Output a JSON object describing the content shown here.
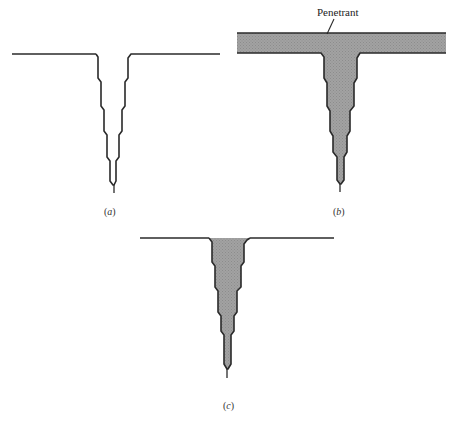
{
  "figure": {
    "colors": {
      "line": "#2a2a2a",
      "penetrant_fill": "#9c9c9c",
      "background": "#ffffff"
    },
    "panels": [
      {
        "id": "a",
        "caption": "(a)",
        "caption_letter": "a",
        "description": "Open surface crack, empty",
        "surface_left": [
          [
            12,
            54
          ],
          [
            96,
            54
          ]
        ],
        "surface_right": [
          [
            136,
            54
          ],
          [
            220,
            54
          ]
        ],
        "crack_outline": [
          [
            96,
            54
          ],
          [
            98,
            57
          ],
          [
            98,
            78
          ],
          [
            101,
            82
          ],
          [
            101,
            106
          ],
          [
            104,
            110
          ],
          [
            104,
            131
          ],
          [
            107,
            135
          ],
          [
            107,
            157
          ],
          [
            110,
            161
          ],
          [
            110,
            181
          ],
          [
            113,
            185
          ],
          [
            114,
            185
          ],
          [
            116,
            181
          ],
          [
            116,
            161
          ],
          [
            119,
            157
          ],
          [
            119,
            135
          ],
          [
            122,
            131
          ],
          [
            122,
            110
          ],
          [
            125,
            106
          ],
          [
            125,
            82
          ],
          [
            128,
            78
          ],
          [
            128,
            58
          ],
          [
            131,
            54
          ],
          [
            136,
            54
          ]
        ],
        "tip_tail": [
          [
            114,
            185
          ],
          [
            114,
            193
          ]
        ],
        "filled": false,
        "caption_pos": {
          "x": 104,
          "y": 207
        }
      },
      {
        "id": "b",
        "caption": "(b)",
        "caption_letter": "b",
        "description": "Crack and surface covered with penetrant",
        "penetrant_band": {
          "x1": 237,
          "x2": 446,
          "top": 33,
          "bottom": 53
        },
        "crack_outline": [
          [
            237,
            53
          ],
          [
            321,
            53
          ],
          [
            324,
            57
          ],
          [
            324,
            78
          ],
          [
            327,
            83
          ],
          [
            327,
            106
          ],
          [
            330,
            111
          ],
          [
            330,
            131
          ],
          [
            333,
            136
          ],
          [
            333,
            152
          ],
          [
            337,
            157
          ],
          [
            337,
            180
          ],
          [
            340,
            184
          ],
          [
            341,
            184
          ],
          [
            344,
            180
          ],
          [
            344,
            157
          ],
          [
            347,
            152
          ],
          [
            347,
            136
          ],
          [
            350,
            131
          ],
          [
            350,
            111
          ],
          [
            354,
            106
          ],
          [
            354,
            83
          ],
          [
            357,
            78
          ],
          [
            357,
            58
          ],
          [
            360,
            53
          ],
          [
            446,
            53
          ]
        ],
        "tip_tail": [
          [
            340,
            184
          ],
          [
            340,
            192
          ]
        ],
        "filled": true,
        "caption_pos": {
          "x": 333,
          "y": 207
        },
        "callout": {
          "text": "Penetrant",
          "text_pos": {
            "x": 317,
            "y": 7
          },
          "leader": [
            [
              334,
              19
            ],
            [
              327,
              34
            ]
          ]
        }
      },
      {
        "id": "c",
        "caption": "(c)",
        "caption_letter": "c",
        "description": "Surface cleaned, penetrant remains in crack",
        "surface_left": [
          [
            140,
            238
          ],
          [
            209,
            238
          ]
        ],
        "surface_right": [
          [
            250,
            238
          ],
          [
            334,
            238
          ]
        ],
        "crack_outline": [
          [
            209,
            238
          ],
          [
            212,
            242
          ],
          [
            212,
            262
          ],
          [
            215,
            266
          ],
          [
            215,
            287
          ],
          [
            218,
            291
          ],
          [
            218,
            312
          ],
          [
            221,
            316
          ],
          [
            221,
            331
          ],
          [
            224,
            335
          ],
          [
            224,
            364
          ],
          [
            227,
            369
          ],
          [
            228,
            369
          ],
          [
            231,
            364
          ],
          [
            231,
            335
          ],
          [
            234,
            331
          ],
          [
            234,
            316
          ],
          [
            237,
            312
          ],
          [
            237,
            291
          ],
          [
            241,
            287
          ],
          [
            241,
            266
          ],
          [
            244,
            262
          ],
          [
            244,
            244
          ],
          [
            247,
            240
          ],
          [
            250,
            238
          ]
        ],
        "tip_tail": [
          [
            227,
            369
          ],
          [
            227,
            378
          ]
        ],
        "filled": true,
        "caption_pos": {
          "x": 223,
          "y": 401
        }
      }
    ]
  }
}
